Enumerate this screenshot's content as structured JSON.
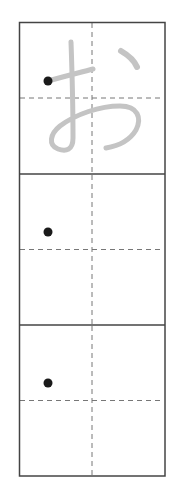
{
  "worksheet": {
    "character": "お",
    "character_name": "hiragana-o",
    "colors": {
      "frame": "#444444",
      "guide": "#777777",
      "trace": "#c4c4c4",
      "start_dot": "#1a1a1a",
      "background": "#ffffff"
    },
    "cells": [
      {
        "index": 1,
        "has_trace_glyph": true,
        "has_start_dot": true
      },
      {
        "index": 2,
        "has_trace_glyph": false,
        "has_start_dot": true
      },
      {
        "index": 3,
        "has_trace_glyph": false,
        "has_start_dot": true
      }
    ]
  }
}
